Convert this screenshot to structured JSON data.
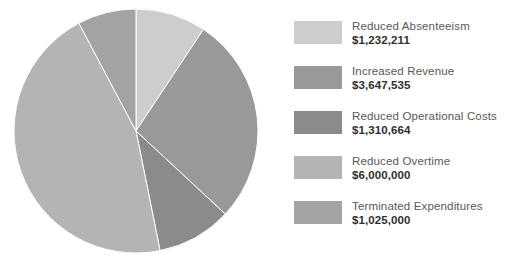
{
  "chart_data": {
    "type": "pie",
    "title": "",
    "subtitle": "",
    "xlabel": "",
    "ylabel": "",
    "legend_position": "right",
    "grid": false,
    "start_angle_deg": 0,
    "direction": "clockwise",
    "categories": [
      "Reduced Absenteeism",
      "Increased Revenue",
      "Reduced Operational Costs",
      "Reduced Overtime",
      "Terminated Expenditures"
    ],
    "values": [
      1232211,
      3647535,
      1310664,
      6000000,
      1025000
    ],
    "value_labels": [
      "$1,232,211",
      "$3,647,535",
      "$1,310,664",
      "$6,000,000",
      "$1,025,000"
    ],
    "colors": [
      "#cdcdcd",
      "#999999",
      "#8b8b8b",
      "#b4b4b4",
      "#a3a3a3"
    ],
    "total": 13215410
  },
  "legend": {
    "items": [
      {
        "label": "Reduced Absenteeism",
        "value": "$1,232,211",
        "color": "#cdcdcd"
      },
      {
        "label": "Increased Revenue",
        "value": "$3,647,535",
        "color": "#999999"
      },
      {
        "label": "Reduced Operational Costs",
        "value": "$1,310,664",
        "color": "#8b8b8b"
      },
      {
        "label": "Reduced Overtime",
        "value": "$6,000,000",
        "color": "#b4b4b4"
      },
      {
        "label": "Terminated Expenditures",
        "value": "$1,025,000",
        "color": "#a3a3a3"
      }
    ]
  }
}
